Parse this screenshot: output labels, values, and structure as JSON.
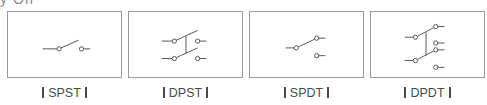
{
  "header_fragment": "y Off",
  "panels": [
    {
      "id": "spst",
      "label": "SPST",
      "description": "Single pole single throw"
    },
    {
      "id": "dpst",
      "label": "DPST",
      "description": "Double pole single throw"
    },
    {
      "id": "spdt",
      "label": "SPDT",
      "description": "Single pole double throw"
    },
    {
      "id": "dpdt",
      "label": "DPDT",
      "description": "Double pole double throw"
    }
  ],
  "colors": {
    "line": "#555555",
    "border": "#999999",
    "text": "#4a4a4a"
  }
}
